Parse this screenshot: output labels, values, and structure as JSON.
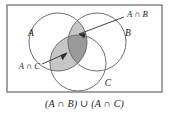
{
  "figure": {
    "kind": "venn-diagram",
    "caption": "(A ∩ B) ∪ (A ∩ C)",
    "universe_label": "",
    "sets": [
      {
        "id": "A",
        "label": "A",
        "cx": 58,
        "cy": 42,
        "r": 29
      },
      {
        "id": "B",
        "label": "B",
        "cx": 97,
        "cy": 42,
        "r": 29
      },
      {
        "id": "C",
        "label": "C",
        "cx": 78,
        "cy": 63,
        "r": 28
      }
    ],
    "set_label_positions": [
      {
        "id": "A",
        "x": 31,
        "y": 36
      },
      {
        "id": "B",
        "x": 128,
        "y": 36
      },
      {
        "id": "C",
        "x": 108,
        "y": 86
      }
    ],
    "callouts": [
      {
        "id": "a-int-b",
        "label": "A ∩ B",
        "label_x": 127,
        "label_y": 14,
        "line_from_x": 124,
        "line_from_y": 17,
        "line_to_x": 79,
        "line_to_y": 34,
        "points_to": "A ∩ B lens"
      },
      {
        "id": "a-int-c",
        "label": "A ∩ C",
        "label_x": 12,
        "label_y": 66,
        "line_from_x": 42,
        "line_from_y": 64,
        "line_to_x": 67,
        "line_to_y": 53,
        "points_to": "A ∩ C lens"
      }
    ],
    "shaded_regions": [
      {
        "id": "a-and-b",
        "description": "A intersect B",
        "color": "#c6c6c6"
      },
      {
        "id": "a-and-c",
        "description": "A intersect C",
        "color": "#c6c6c6"
      },
      {
        "id": "a-and-b-and-c",
        "description": "A intersect B intersect C",
        "color": "#9a9a9a"
      }
    ],
    "colors": {
      "light_shade": "#c6c6c6",
      "dark_shade": "#9a9a9a",
      "circle_stroke": "#6e6e6e",
      "frame_stroke": "#585858",
      "text": "#1a1a1a",
      "background": "#ffffff"
    },
    "frame": {
      "x": 7,
      "y": 5,
      "width": 155,
      "height": 87
    }
  }
}
